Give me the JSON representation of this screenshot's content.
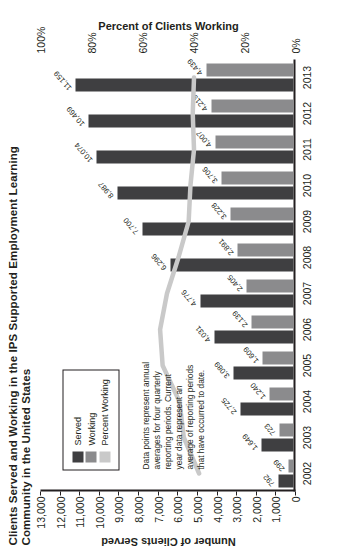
{
  "chart_data": {
    "type": "bar",
    "title": "Clients Served and Working in the IPS Supported Employment Learning Community in the United States",
    "xlabel": "",
    "ylabel": "Number of Clients Served",
    "y2label": "Percent of Clients Working",
    "categories": [
      "2002",
      "2003",
      "2004",
      "2005",
      "2006",
      "2007",
      "2008",
      "2009",
      "2010",
      "2011",
      "2012",
      "2013"
    ],
    "ylim": [
      0,
      13000
    ],
    "yticks": [
      "0",
      "1,000",
      "2,000",
      "3,000",
      "4,000",
      "5,000",
      "6,000",
      "7,000",
      "8,000",
      "9,000",
      "10,000",
      "11,000",
      "12,000",
      "13,000"
    ],
    "ytick_values": [
      0,
      1000,
      2000,
      3000,
      4000,
      5000,
      6000,
      7000,
      8000,
      9000,
      10000,
      11000,
      12000,
      13000
    ],
    "y2lim": [
      0,
      100
    ],
    "y2ticks": [
      "0%",
      "20%",
      "40%",
      "60%",
      "80%",
      "100%"
    ],
    "y2tick_values": [
      0,
      20,
      40,
      60,
      80,
      100
    ],
    "grid": false,
    "legend_position": "upper-left-inside",
    "series": [
      {
        "name": "Served",
        "kind": "bar",
        "color": "#3f3f41",
        "values": [
          792,
          1649,
          2725,
          3089,
          4031,
          4776,
          6296,
          7700,
          8987,
          10074,
          10469,
          11159
        ],
        "labels": [
          "792",
          "1,649",
          "2,725",
          "3,089",
          "4,031",
          "4,776",
          "6,296",
          "7,700",
          "8,987",
          "10,074",
          "10,469",
          "11,159"
        ]
      },
      {
        "name": "Working",
        "kind": "bar",
        "color": "#8b8b8d",
        "values": [
          299,
          723,
          1240,
          1609,
          2139,
          2405,
          2891,
          3228,
          3706,
          4007,
          4219,
          4439
        ],
        "labels": [
          "299",
          "723",
          "1,240",
          "1,609",
          "2,139",
          "2,405",
          "2,891",
          "3,228",
          "3,706",
          "4,007",
          "4,219",
          "4,439"
        ]
      },
      {
        "name": "Percent Working",
        "kind": "line",
        "color": "#c9c9c9",
        "axis": "secondary",
        "values": [
          37.8,
          43.8,
          45.5,
          52.1,
          53.1,
          50.4,
          45.9,
          41.9,
          41.2,
          39.8,
          40.3,
          39.8
        ]
      }
    ],
    "annotation": "Data points represent annual averages for four quarterly reporting periods. Current year data represent an average of reporting periods that have occurred to date."
  },
  "legend": {
    "items": [
      {
        "label": "Served",
        "swatch": "served"
      },
      {
        "label": "Working",
        "swatch": "working"
      },
      {
        "label": "Percent Working",
        "swatch": "pct"
      }
    ]
  }
}
